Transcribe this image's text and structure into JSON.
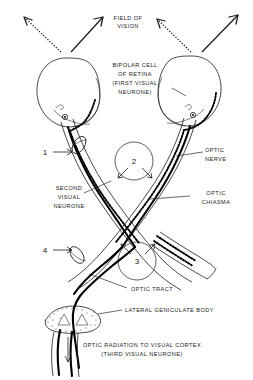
{
  "figure": {
    "background_color": "#ffffff",
    "ink_color": "#1a1a1a"
  },
  "labels": {
    "field_of_vision": "FIELD OF\nVISION",
    "field_of_vision_line1": "FIELD OF",
    "field_of_vision_line2": "VISION",
    "bipolar_cell_line1": "BIPOLAR CELL",
    "bipolar_cell_line2": "OF  RETINA",
    "bipolar_cell_line3": "(FIRST VISUAL",
    "bipolar_cell_line4": "NEURONE)",
    "second_neurone_line1": "SECOND",
    "second_neurone_line2": "VISUAL",
    "second_neurone_line3": "NEURONE",
    "optic_nerve_line1": "OPTIC",
    "optic_nerve_line2": "NERVE",
    "optic_chiasma_line1": "OPTIC",
    "optic_chiasma_line2": "CHIASMA",
    "optic_tract": "OPTIC TRACT",
    "lateral_geniculate_body": "LATERAL  GENICULATE  BODY",
    "optic_radiation_line1": "OPTIC  RADIATION TO VISUAL CORTEX",
    "optic_radiation_line2": "(THIRD  VISUAL  NEURONE)"
  },
  "markers": [
    {
      "id": "marker-1",
      "label": "1",
      "x": 45,
      "y": 152,
      "arrow": "right"
    },
    {
      "id": "marker-2",
      "label": "2",
      "x": 134,
      "y": 160,
      "arrow": "down-split"
    },
    {
      "id": "marker-3",
      "label": "3",
      "x": 137,
      "y": 258,
      "arrow": "up-split"
    },
    {
      "id": "marker-4",
      "label": "4",
      "x": 45,
      "y": 250,
      "arrow": "right"
    }
  ],
  "field_arrows": [
    {
      "id": "left-dotted",
      "style": "dotted",
      "direction": "up-left"
    },
    {
      "id": "left-solid",
      "style": "solid",
      "direction": "up-right"
    },
    {
      "id": "right-dotted",
      "style": "dotted",
      "direction": "up-left"
    },
    {
      "id": "right-solid",
      "style": "solid",
      "direction": "up-right"
    }
  ],
  "pathways": [
    {
      "id": "left-temporal-solid",
      "style": "solid",
      "side": "left"
    },
    {
      "id": "left-nasal-dotted",
      "style": "dotted",
      "side": "left"
    },
    {
      "id": "right-temporal-solid",
      "style": "solid",
      "side": "right"
    },
    {
      "id": "right-nasal-dotted",
      "style": "dotted",
      "side": "right"
    }
  ]
}
